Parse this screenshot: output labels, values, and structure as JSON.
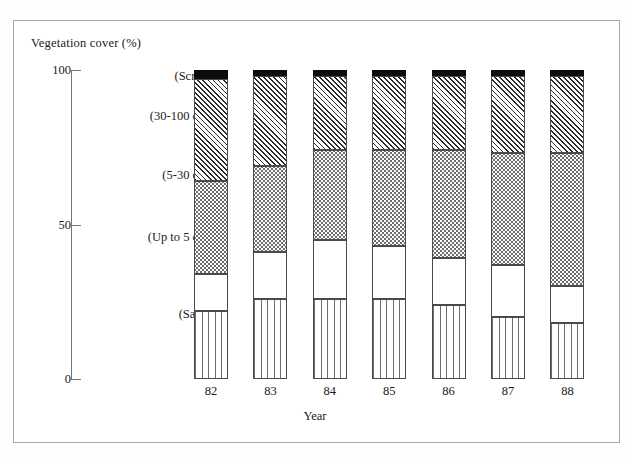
{
  "figure": {
    "y_axis_title": "Vegetation cover (%)",
    "x_axis_title": "Year"
  },
  "chart_data": {
    "type": "bar",
    "subtype": "stacked-vertical-100",
    "title": "",
    "xlabel": "Year",
    "ylabel": "Vegetation cover (%)",
    "ylim": [
      0,
      100
    ],
    "yticks": [
      0,
      50,
      100
    ],
    "ytick_labels": [
      "0",
      "50",
      "100"
    ],
    "grid": false,
    "legend_position": "inside-left-stack-labels",
    "categories": [
      "82",
      "83",
      "84",
      "85",
      "86",
      "87",
      "88"
    ],
    "series": [
      {
        "name": "(Sand)",
        "label": "(Sand)",
        "fill": "vertical-lines",
        "values": [
          22,
          26,
          26,
          26,
          24,
          20,
          18
        ]
      },
      {
        "name": "(Up to 5 cm)",
        "label": "(Up to 5 cm)",
        "fill": "blank-white",
        "values": [
          12,
          15,
          19,
          17,
          15,
          17,
          12
        ]
      },
      {
        "name": "(5-30 cm)",
        "label": "(5-30 cm)",
        "fill": "stipple-dots",
        "values": [
          30,
          28,
          29,
          31,
          35,
          36,
          43
        ]
      },
      {
        "name": "(30-100 cm)",
        "label": "(30-100 cm)",
        "fill": "diagonal-hatch",
        "values": [
          33,
          29,
          24,
          24,
          24,
          25,
          25
        ]
      },
      {
        "name": "(Scrub)",
        "label": "(Scrub)",
        "fill": "solid-black",
        "values": [
          3,
          2,
          2,
          2,
          2,
          2,
          2
        ]
      }
    ],
    "series_label_y_percent": [
      21,
      46,
      66,
      85,
      98
    ]
  }
}
